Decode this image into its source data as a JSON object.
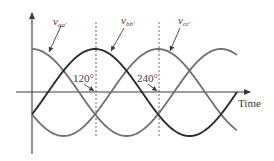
{
  "diagram": {
    "type": "three-phase-voltage-waveforms",
    "axes": {
      "x_label": "Time",
      "y_axis": "voltage"
    },
    "waveforms": [
      {
        "id": "vaa",
        "label_main": "v",
        "label_sub": "aa'",
        "phase_deg": 0,
        "color": "#6e6e6e"
      },
      {
        "id": "vbb",
        "label_main": "v",
        "label_sub": "bb'",
        "phase_deg": 120,
        "color": "#2b2b2b"
      },
      {
        "id": "vcc",
        "label_main": "v",
        "label_sub": "cc'",
        "phase_deg": 240,
        "color": "#6e6e6e"
      }
    ],
    "markers": [
      {
        "label": "120°",
        "angle_deg": 120
      },
      {
        "label": "240°",
        "angle_deg": 240
      }
    ],
    "colors": {
      "axis": "#3a3a3a",
      "dashed": "#555555",
      "text": "#3a3a3a"
    }
  }
}
